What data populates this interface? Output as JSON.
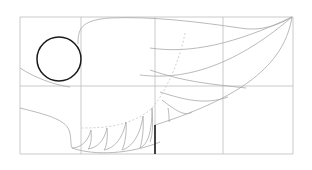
{
  "figure": {
    "title": "",
    "grid": {
      "left": 20,
      "top": 17,
      "right": 293,
      "bottom": 154,
      "columns_x": [
        20,
        81,
        155,
        223,
        293
      ],
      "rows_y": [
        17,
        86,
        154
      ],
      "stroke": "#bdbdbd"
    },
    "circle": {
      "cx": 59,
      "cy": 59,
      "r": 22,
      "stroke": "#1a1a1a"
    },
    "wing_stroke": "#a8a8a8",
    "guide_stroke": "#c4c4c4",
    "accent_line": {
      "x": 155,
      "y1": 125,
      "y2": 154,
      "stroke": "#1a1a1a"
    }
  }
}
